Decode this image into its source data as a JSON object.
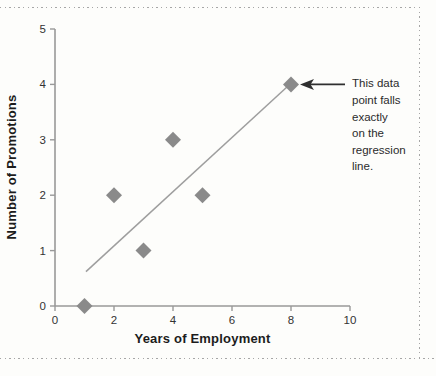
{
  "figure": {
    "background": "#fdfdfb",
    "border_dot_color": "#a6a6a6"
  },
  "chart_data": {
    "type": "scatter",
    "title": "",
    "xlabel": "Years of Employment",
    "ylabel": "Number of Promotions",
    "xlim": [
      0,
      10
    ],
    "ylim": [
      0,
      5
    ],
    "x_ticks": [
      0,
      2,
      4,
      6,
      8,
      10
    ],
    "x_tick_labels": [
      "0",
      "2",
      "4",
      "6",
      "8",
      "10"
    ],
    "y_ticks": [
      0,
      1,
      2,
      3,
      4,
      5
    ],
    "y_tick_labels": [
      "0",
      "1",
      "2",
      "3",
      "4",
      "5"
    ],
    "grid": false,
    "legend": "none",
    "points": [
      [
        1,
        0
      ],
      [
        2,
        2
      ],
      [
        3,
        1
      ],
      [
        4,
        3
      ],
      [
        5,
        2
      ],
      [
        8,
        4
      ]
    ],
    "regression_line": {
      "x1": 1.05,
      "y1": 0.62,
      "x2": 7.9,
      "y2": 3.97
    },
    "marker": {
      "shape": "diamond",
      "color": "#8a8a8a",
      "size": 16
    },
    "line_color": "#9e9e9e",
    "axis_color": "#999999",
    "tick_label_color": "#333333",
    "tick_label_size": 11.5
  },
  "annotation": {
    "text": "This data point falls exactly on the regression line.",
    "lines": [
      "This data",
      "point falls",
      "exactly",
      "on the",
      "regression",
      "line."
    ],
    "target_point": [
      8,
      4
    ],
    "arrow_color": "#2f2f2f",
    "text_color": "#2b2b2b"
  }
}
